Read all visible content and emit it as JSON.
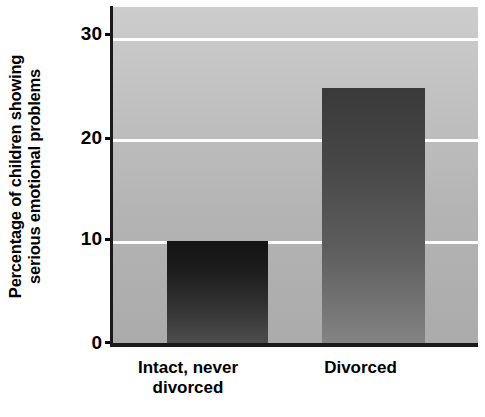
{
  "chart_data": {
    "type": "bar",
    "title": "",
    "xlabel": "",
    "ylabel_line1": "Percentage of children showing",
    "ylabel_line2": "serious emotional problems",
    "categories": [
      "Intact, never divorced",
      "Divorced"
    ],
    "category_lines": [
      [
        "Intact, never",
        "divorced"
      ],
      [
        "Divorced",
        ""
      ]
    ],
    "values": [
      10,
      25
    ],
    "ylim": [
      0,
      33
    ],
    "yticks": [
      0,
      10,
      20,
      30
    ],
    "ytick_labels": [
      "0",
      "10",
      "20",
      "30"
    ],
    "gridlines": [
      10,
      20,
      30
    ],
    "grid": true,
    "legend": "none",
    "colors": {
      "plot_background_top": "#cdcdcd",
      "plot_background_bottom": "#ababab",
      "gridline": "#fdfdfd",
      "axis": "#1a1a1a",
      "bar_intact_top": "#141414",
      "bar_intact_bottom": "#4d4d4d",
      "bar_divorced_top": "#3a3a3a",
      "bar_divorced_bottom": "#838383",
      "text": "#000000",
      "page_background": "#ffffff"
    }
  }
}
